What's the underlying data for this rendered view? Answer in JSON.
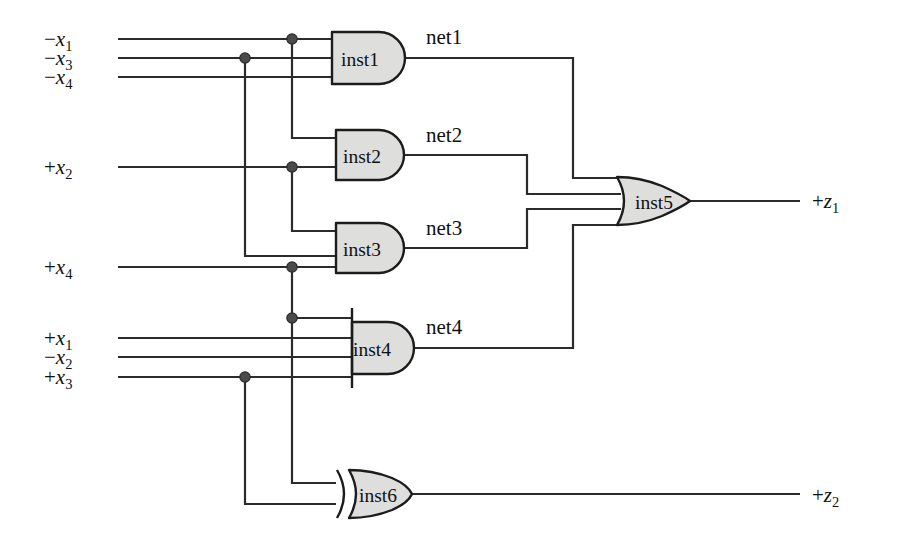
{
  "diagram": {
    "background_color": "#ffffff",
    "wire_color": "#2b2b2b",
    "gate_fill_color": "#dededd",
    "gate_stroke_color": "#1c1c1c",
    "junction_color": "#4a4a4a"
  },
  "inputs": [
    {
      "id": "in_nx1",
      "sign": "−",
      "var": "x",
      "sub": "1",
      "text": "−x1",
      "y": 39,
      "drives": [
        "inst1",
        "inst2"
      ]
    },
    {
      "id": "in_nx3",
      "sign": "−",
      "var": "x",
      "sub": "3",
      "text": "−x3",
      "y": 58,
      "drives": [
        "inst1",
        "inst3"
      ]
    },
    {
      "id": "in_nx4",
      "sign": "−",
      "var": "x",
      "sub": "4",
      "text": "−x4",
      "y": 77,
      "drives": [
        "inst1"
      ]
    },
    {
      "id": "in_px2",
      "sign": "+",
      "var": "x",
      "sub": "2",
      "text": "+x2",
      "y": 167,
      "drives": [
        "inst2",
        "inst3"
      ]
    },
    {
      "id": "in_px4",
      "sign": "+",
      "var": "x",
      "sub": "4",
      "text": "+x4",
      "y": 267,
      "drives": [
        "inst3",
        "inst4",
        "inst6"
      ]
    },
    {
      "id": "in_px1",
      "sign": "+",
      "var": "x",
      "sub": "1",
      "text": "+x1",
      "y": 338,
      "drives": [
        "inst4"
      ]
    },
    {
      "id": "in_nx2",
      "sign": "−",
      "var": "x",
      "sub": "2",
      "text": "−x2",
      "y": 357,
      "drives": [
        "inst4"
      ]
    },
    {
      "id": "in_px3",
      "sign": "+",
      "var": "x",
      "sub": "3",
      "text": "+x3",
      "y": 377,
      "drives": [
        "inst4",
        "inst6"
      ]
    }
  ],
  "outputs": [
    {
      "id": "out_pz1",
      "sign": "+",
      "var": "z",
      "sub": "1",
      "text": "+z1",
      "y": 200,
      "driven_by": "inst5"
    },
    {
      "id": "out_pz2",
      "sign": "+",
      "var": "z",
      "sub": "2",
      "text": "+z2",
      "y": 494,
      "driven_by": "inst6"
    }
  ],
  "gates": [
    {
      "id": "inst1",
      "label": "inst1",
      "type": "AND",
      "inputs": 3,
      "output_net": "net1",
      "cx": 367,
      "cy": 58
    },
    {
      "id": "inst2",
      "label": "inst2",
      "type": "AND",
      "inputs": 2,
      "output_net": "net2",
      "cx": 367,
      "cy": 155
    },
    {
      "id": "inst3",
      "label": "inst3",
      "type": "AND",
      "inputs": 2,
      "output_net": "net3",
      "cx": 367,
      "cy": 248
    },
    {
      "id": "inst4",
      "label": "inst4",
      "type": "AND",
      "inputs": 4,
      "output_net": "net4",
      "cx": 374,
      "cy": 348
    },
    {
      "id": "inst5",
      "label": "inst5",
      "type": "OR",
      "inputs": 4,
      "output_net": "+z1",
      "cx": 653,
      "cy": 201
    },
    {
      "id": "inst6",
      "label": "inst6",
      "type": "XOR",
      "inputs": 2,
      "output_net": "+z2",
      "cx": 374,
      "cy": 494
    }
  ],
  "nets": [
    {
      "id": "net1",
      "label": "net1",
      "from": "inst1",
      "to": "inst5",
      "label_x": 426,
      "label_y": 44
    },
    {
      "id": "net2",
      "label": "net2",
      "from": "inst2",
      "to": "inst5",
      "label_x": 426,
      "label_y": 142
    },
    {
      "id": "net3",
      "label": "net3",
      "from": "inst3",
      "to": "inst5",
      "label_x": 426,
      "label_y": 235
    },
    {
      "id": "net4",
      "label": "net4",
      "from": "inst4",
      "to": "inst5",
      "label_x": 426,
      "label_y": 334
    }
  ],
  "junctions": [
    {
      "id": "j_nx1",
      "x": 292,
      "y": 39,
      "on_net": "−x1"
    },
    {
      "id": "j_nx3",
      "x": 245,
      "y": 58,
      "on_net": "−x3"
    },
    {
      "id": "j_px2",
      "x": 292,
      "y": 167,
      "on_net": "+x2"
    },
    {
      "id": "j_px4",
      "x": 292,
      "y": 267,
      "on_net": "+x4"
    },
    {
      "id": "j_px4_tap",
      "x": 292,
      "y": 318,
      "on_net": "+x4"
    },
    {
      "id": "j_px3",
      "x": 245,
      "y": 377,
      "on_net": "+x3"
    }
  ]
}
